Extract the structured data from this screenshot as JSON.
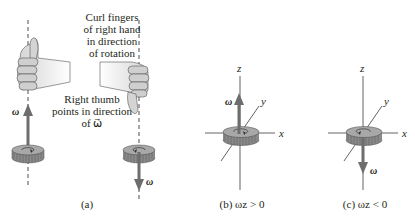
{
  "panel_a": {
    "caption": "(a)",
    "curl_text": [
      "Curl fingers",
      "of right hand",
      "in direction",
      "of rotation"
    ],
    "thumb_text": [
      "Right thumb",
      "points in direction",
      "of ω⃗"
    ],
    "left_vector_label": "ω⃗",
    "right_vector_label": "ω⃗"
  },
  "panel_b": {
    "caption": "(b) ωz > 0",
    "axis_z": "z",
    "axis_y": "y",
    "axis_x": "x",
    "vector_label": "ω⃗"
  },
  "panel_c": {
    "caption": "(c) ωz < 0",
    "axis_z": "z",
    "axis_y": "y",
    "axis_x": "x",
    "vector_label": "ω⃗"
  },
  "colors": {
    "gear_fill": "#8a8a8a",
    "gear_top": "#a8a8a8",
    "arrow": "#6d6d6d",
    "hand_fill": "#d9d9d9",
    "line": "#231f20"
  }
}
